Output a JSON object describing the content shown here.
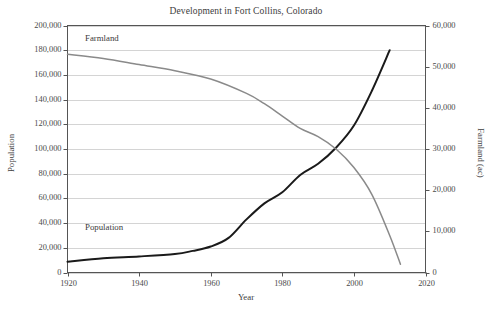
{
  "chart_data": {
    "type": "line",
    "title": "Development in Fort Collins, Colorado",
    "xlabel": "Year",
    "ylabel": "Population",
    "y2label": "Farmland (ac)",
    "xlim": [
      1920,
      2020
    ],
    "ylim": [
      0,
      200000
    ],
    "y2lim": [
      0,
      60000
    ],
    "grid": true,
    "legend_position": "inline-annotations",
    "xticks": [
      "1920",
      "1940",
      "1960",
      "1980",
      "2000",
      "2020"
    ],
    "xtick_values": [
      1920,
      1940,
      1960,
      1980,
      2000,
      2020
    ],
    "yticks": [
      "0",
      "20,000",
      "40,000",
      "60,000",
      "80,000",
      "100,000",
      "120,000",
      "140,000",
      "160,000",
      "180,000",
      "200,000"
    ],
    "ytick_values": [
      0,
      20000,
      40000,
      60000,
      80000,
      100000,
      120000,
      140000,
      160000,
      180000,
      200000
    ],
    "y2ticks": [
      "0",
      "10,000",
      "20,000",
      "30,000",
      "40,000",
      "50,000",
      "60,000"
    ],
    "y2tick_values": [
      0,
      10000,
      20000,
      30000,
      40000,
      50000,
      60000
    ],
    "series": [
      {
        "name": "Population",
        "axis": "left",
        "color": "#1a1a1a",
        "annotation": "Population",
        "x": [
          1920,
          1930,
          1940,
          1950,
          1955,
          1960,
          1965,
          1970,
          1975,
          1980,
          1985,
          1990,
          1995,
          2000,
          2005,
          2010
        ],
        "values": [
          8800,
          11500,
          13000,
          15000,
          17500,
          21000,
          28000,
          43000,
          56000,
          65000,
          79000,
          88000,
          101000,
          119000,
          147000,
          180000
        ]
      },
      {
        "name": "Farmland",
        "axis": "right",
        "color": "#8a8a8a",
        "annotation": "Farmland",
        "x": [
          1920,
          1930,
          1940,
          1950,
          1960,
          1970,
          1975,
          1980,
          1985,
          1990,
          1995,
          2000,
          2005,
          2010,
          2013
        ],
        "values": [
          53000,
          52000,
          50500,
          49000,
          47000,
          43500,
          41000,
          38000,
          35000,
          33000,
          30000,
          25500,
          19000,
          9000,
          2000
        ]
      }
    ]
  }
}
